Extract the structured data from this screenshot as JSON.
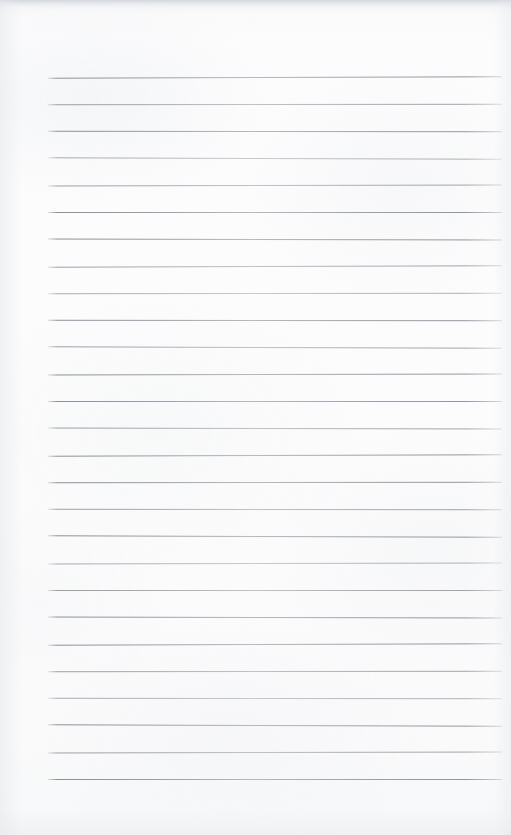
{
  "document": {
    "kind": "ruled-notebook-paper",
    "title": "Blank lined paper",
    "has_text": false,
    "page_width": 511,
    "page_height": 835
  },
  "paper": {
    "background_color": "#fbfbfc",
    "top_edge_shade_color": "#c4c8ce",
    "texture": "subtle-mottled-scan"
  },
  "ruling": {
    "line_color": "#8a8c95",
    "line_thickness_px": 1,
    "line_count": 27,
    "line_spacing_px": 27,
    "first_line_y": 77,
    "last_line_y": 779,
    "line_start_x": 48,
    "line_end_x": 502,
    "margin_left_px": 48,
    "margin_right_px": 9,
    "margin_top_px": 77,
    "margin_bottom_px": 56,
    "line_y_positions": [
      77,
      104,
      131,
      158,
      185,
      212,
      239,
      266,
      293,
      320,
      347,
      374,
      401,
      428,
      455,
      482,
      509,
      536,
      563,
      590,
      617,
      644,
      671,
      698,
      725,
      752,
      779
    ]
  },
  "content": {
    "written_text": "",
    "annotations": []
  }
}
